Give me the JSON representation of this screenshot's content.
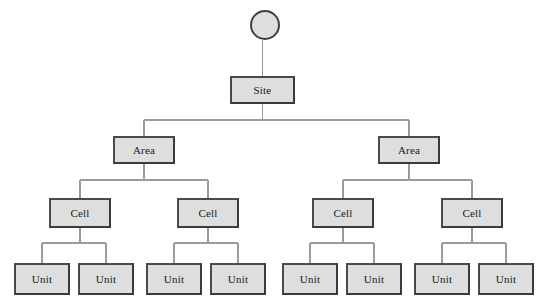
{
  "diagram": {
    "type": "hierarchy-tree",
    "orientation": "top-down",
    "background_color": "#ffffff",
    "node_fill_color": "#dedede",
    "node_border_color": "#3f3f3f",
    "connector_color": "#9a9a9a",
    "root": {
      "name": "root-circle",
      "shape": "circle",
      "label": "",
      "cx": 265,
      "cy": 25,
      "r": 15
    },
    "levels": [
      {
        "level": 1,
        "level_name": "site",
        "nodes": [
          {
            "label": "Site",
            "x": 230,
            "y": 76,
            "w": 65,
            "h": 28
          }
        ]
      },
      {
        "level": 2,
        "level_name": "area",
        "nodes": [
          {
            "label": "Area",
            "x": 113,
            "y": 136,
            "w": 62,
            "h": 28
          },
          {
            "label": "Area",
            "x": 378,
            "y": 136,
            "w": 62,
            "h": 28
          }
        ]
      },
      {
        "level": 3,
        "level_name": "cell",
        "nodes": [
          {
            "label": "Cell",
            "x": 49,
            "y": 198,
            "w": 62,
            "h": 30
          },
          {
            "label": "Cell",
            "x": 177,
            "y": 198,
            "w": 62,
            "h": 30
          },
          {
            "label": "Cell",
            "x": 312,
            "y": 198,
            "w": 62,
            "h": 30
          },
          {
            "label": "Cell",
            "x": 441,
            "y": 198,
            "w": 62,
            "h": 30
          }
        ]
      },
      {
        "level": 4,
        "level_name": "unit",
        "nodes": [
          {
            "label": "Unit",
            "x": 14,
            "y": 263,
            "w": 56,
            "h": 32
          },
          {
            "label": "Unit",
            "x": 78,
            "y": 263,
            "w": 56,
            "h": 32
          },
          {
            "label": "Unit",
            "x": 146,
            "y": 263,
            "w": 56,
            "h": 32
          },
          {
            "label": "Unit",
            "x": 210,
            "y": 263,
            "w": 56,
            "h": 32
          },
          {
            "label": "Unit",
            "x": 282,
            "y": 263,
            "w": 56,
            "h": 32
          },
          {
            "label": "Unit",
            "x": 346,
            "y": 263,
            "w": 56,
            "h": 32
          },
          {
            "label": "Unit",
            "x": 414,
            "y": 263,
            "w": 56,
            "h": 32
          },
          {
            "label": "Unit",
            "x": 478,
            "y": 263,
            "w": 56,
            "h": 32
          }
        ]
      }
    ],
    "bus_lines": [
      {
        "name": "site-to-area-bus",
        "y": 120,
        "x1": 144,
        "x2": 409
      },
      {
        "name": "area1-to-cell-bus",
        "y": 180,
        "x1": 80,
        "x2": 208
      },
      {
        "name": "area2-to-cell-bus",
        "y": 180,
        "x1": 343,
        "x2": 472
      },
      {
        "name": "cell1-to-unit-bus",
        "y": 243,
        "x1": 42,
        "x2": 106
      },
      {
        "name": "cell2-to-unit-bus",
        "y": 243,
        "x1": 174,
        "x2": 238
      },
      {
        "name": "cell3-to-unit-bus",
        "y": 243,
        "x1": 310,
        "x2": 374
      },
      {
        "name": "cell4-to-unit-bus",
        "y": 243,
        "x1": 442,
        "x2": 506
      }
    ]
  }
}
